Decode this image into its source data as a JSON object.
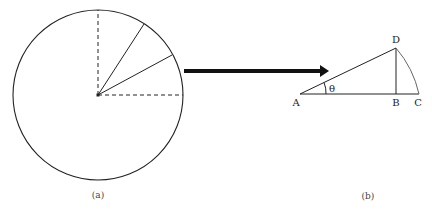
{
  "figure": {
    "panel_a": {
      "caption": "(a)",
      "description": "Circle with two dashed radii at 90° (up and right) and two solid radii between them"
    },
    "arrow": {
      "direction": "right",
      "meaning": "panel (a) sector magnified into panel (b)"
    },
    "panel_b": {
      "caption": "(b)",
      "points": {
        "A": "A",
        "B": "B",
        "C": "C",
        "D": "D"
      },
      "angle_label": "θ"
    },
    "colors": {
      "stroke": "#222222",
      "arc": "#666666",
      "background": "#ffffff"
    }
  }
}
